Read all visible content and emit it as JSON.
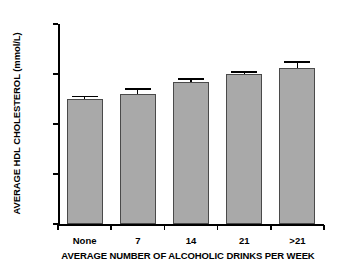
{
  "chart_data": {
    "type": "bar",
    "title": "",
    "subtitle": "",
    "xlabel": "AVERAGE NUMBER OF ALCOHOLIC DRINKS PER WEEK",
    "ylabel": "AVERAGE HDL CHOLESTEROL (mmol/L)",
    "categories": [
      "None",
      "7",
      "14",
      "21",
      ">21"
    ],
    "values": [
      1.0,
      1.04,
      1.14,
      1.2,
      1.25
    ],
    "errors": [
      0.02,
      0.04,
      0.02,
      0.015,
      0.045
    ],
    "ylim": [
      0,
      1.6
    ],
    "yticks": [
      "0",
      "0.4",
      "0.8",
      "1.2",
      "1.6"
    ],
    "ytick_values": [
      0,
      0.4,
      0.8,
      1.2,
      1.6
    ],
    "grid": false,
    "legend": false,
    "legend_position": "none",
    "bar_color": "#a9a9a9",
    "bar_edge_color": "#4a4a4a",
    "error_color": "#000000",
    "axis_color": "#000000"
  }
}
